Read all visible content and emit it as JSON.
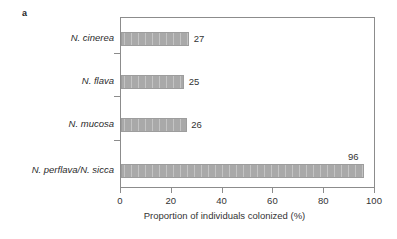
{
  "figure": {
    "panel_label": "a"
  },
  "chart_data": {
    "type": "bar",
    "orientation": "horizontal",
    "title": "",
    "xlabel": "Proportion of individuals colonized (%)",
    "ylabel": "",
    "xlim": [
      0,
      100
    ],
    "xticks": [
      0,
      20,
      40,
      60,
      80,
      100
    ],
    "xticklabels": [
      "0",
      "20",
      "40",
      "60",
      "80",
      "100"
    ],
    "grid": false,
    "legend": false,
    "bar_color": "#a9a9a9",
    "bar_pattern": "vertical-stripes",
    "categories": [
      "N. cinerea",
      "N. flava",
      "N. mucosa",
      "N. perflava/N. sicca"
    ],
    "values": [
      27,
      25,
      26,
      96
    ],
    "value_labels": [
      "27",
      "25",
      "26",
      "96"
    ],
    "value_label_placement": [
      "right",
      "right",
      "right",
      "above"
    ]
  }
}
